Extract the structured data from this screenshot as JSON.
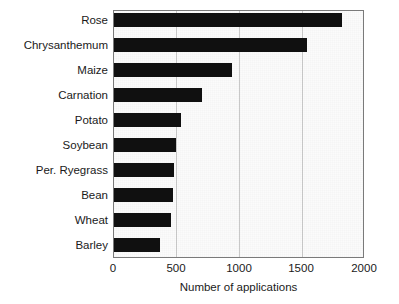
{
  "chart_data": {
    "type": "bar",
    "orientation": "horizontal",
    "title": "",
    "xlabel": "Number of applications",
    "ylabel": "",
    "xlim": [
      0,
      2000
    ],
    "xticks": [
      0,
      500,
      1000,
      1500,
      2000
    ],
    "xtick_labels": [
      "0",
      "500",
      "1000",
      "1500",
      "2000"
    ],
    "grid": true,
    "grid_axis": "x",
    "legend": false,
    "categories": [
      "Rose",
      "Chrysanthemum",
      "Maize",
      "Carnation",
      "Potato",
      "Soybean",
      "Per. Ryegrass",
      "Bean",
      "Wheat",
      "Barley"
    ],
    "values": [
      1830,
      1550,
      950,
      710,
      540,
      500,
      480,
      470,
      460,
      370
    ],
    "bar_color": "#101010",
    "plot_background": "#fbfbfb",
    "axis_color": "#7a7a7a",
    "gridline_color": "#c9c9c9"
  }
}
